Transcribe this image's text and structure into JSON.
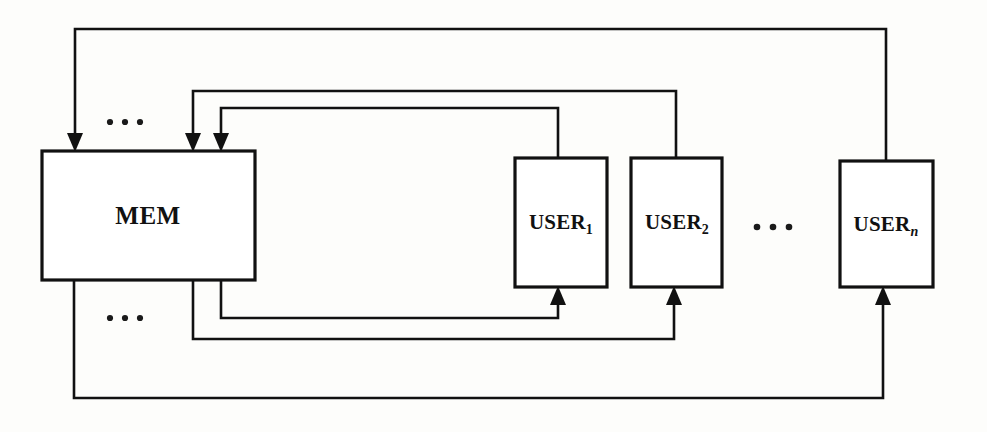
{
  "diagram": {
    "type": "block-diagram",
    "nodes": [
      {
        "id": "mem",
        "label": "MEM",
        "subscript": "",
        "x": 42,
        "y": 151,
        "w": 213,
        "h": 129
      },
      {
        "id": "user1",
        "label": "USER",
        "subscript": "1",
        "x": 515,
        "y": 158,
        "w": 92,
        "h": 129
      },
      {
        "id": "user2",
        "label": "USER",
        "subscript": "2",
        "x": 631,
        "y": 158,
        "w": 91,
        "h": 129
      },
      {
        "id": "usern",
        "label": "USER",
        "subscript": "n",
        "x": 840,
        "y": 161,
        "w": 93,
        "h": 126
      }
    ],
    "ellipses": [
      {
        "id": "ellipsis-mem-top",
        "label": "...",
        "x": 125,
        "y": 122
      },
      {
        "id": "ellipsis-mem-bottom",
        "label": "...",
        "x": 125,
        "y": 318
      },
      {
        "id": "ellipsis-users",
        "label": "...",
        "x": 772,
        "y": 227
      }
    ],
    "edges": [
      {
        "id": "edge-usern-to-mem",
        "from": "usern",
        "to": "mem",
        "direction": "into-mem"
      },
      {
        "id": "edge-user2-to-mem",
        "from": "user2",
        "to": "mem",
        "direction": "into-mem"
      },
      {
        "id": "edge-user1-to-mem",
        "from": "user1",
        "to": "mem",
        "direction": "into-mem"
      },
      {
        "id": "edge-mem-to-user1",
        "from": "mem",
        "to": "user1",
        "direction": "into-user"
      },
      {
        "id": "edge-mem-to-user2",
        "from": "mem",
        "to": "user2",
        "direction": "into-user"
      },
      {
        "id": "edge-mem-to-usern",
        "from": "mem",
        "to": "usern",
        "direction": "into-user"
      }
    ],
    "colors": {
      "stroke": "#111111",
      "fill": "#ffffff",
      "background": "#fdfdfb"
    }
  }
}
